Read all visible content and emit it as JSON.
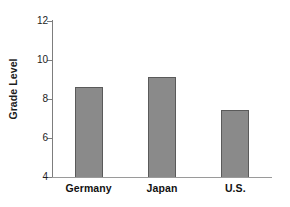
{
  "chart_data": {
    "type": "bar",
    "title": "",
    "xlabel": "",
    "ylabel": "Grade Level",
    "categories": [
      "Germany",
      "Japan",
      "U.S."
    ],
    "values": [
      8.6,
      9.15,
      7.45
    ],
    "ylim": [
      4,
      12
    ],
    "yticks": [
      4,
      6,
      8,
      10,
      12
    ],
    "ytick_labels": [
      "4",
      "6",
      "8",
      "10",
      "12"
    ],
    "grid": false,
    "legend": null,
    "legend_position": "none",
    "bar_color": "#8a8a8a",
    "bar_edge_color": "#5a5a5a",
    "axis_color": "#7d7d7d",
    "background_color": "#ffffff",
    "text_color": "#111111",
    "annotations": []
  }
}
